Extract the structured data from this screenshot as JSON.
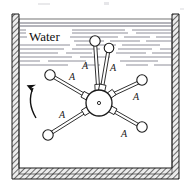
{
  "figure": {
    "medium_label": "Water",
    "arm_label": "A",
    "rotation_direction": "counterclockwise",
    "colors": {
      "outline": "#1a1a1a",
      "water_line": "#5a5a6a",
      "wall_hatch": "#4a4a4a",
      "wall_fill": "#e8e8e8",
      "background": "#ffffff",
      "ball_fill": "#ffffff",
      "hub_fill": "#ffffff"
    },
    "tank": {
      "name": "open-top-tank",
      "outer": {
        "x": 12,
        "y": 14,
        "width": 167,
        "height": 165
      },
      "inner": {
        "x": 19,
        "y": 19,
        "width": 153,
        "height": 155
      },
      "wall_thickness": 6
    },
    "hub": {
      "name": "paddle-wheel-hub",
      "cx": 99,
      "cy": 103,
      "r": 13,
      "center_dot_r": 1.6
    },
    "arms": [
      {
        "id": "arm-upper-vertical",
        "angle_deg": 93,
        "ball_cx": 95,
        "ball_cy": 41,
        "ball_r": 5.2,
        "label": "A",
        "label_x": 85,
        "label_y": 69
      },
      {
        "id": "arm-upper-right-steep",
        "angle_deg": 78,
        "ball_cx": 109,
        "ball_cy": 48,
        "ball_r": 4.8,
        "label": "A",
        "label_x": 113,
        "label_y": 71
      },
      {
        "id": "arm-upper-right",
        "angle_deg": 36,
        "ball_cx": 142,
        "ball_cy": 80,
        "ball_r": 5.2,
        "label": "A",
        "label_x": 136,
        "label_y": 100
      },
      {
        "id": "arm-lower-right",
        "angle_deg": -28,
        "ball_cx": 142,
        "ball_cy": 127,
        "ball_r": 5.2,
        "label": "A",
        "label_x": 124,
        "label_y": 137
      },
      {
        "id": "arm-lower-left",
        "angle_deg": 212,
        "ball_cx": 48,
        "ball_cy": 135,
        "ball_r": 5.2,
        "label": "A",
        "label_x": 62,
        "label_y": 118
      },
      {
        "id": "arm-upper-left",
        "angle_deg": 152,
        "ball_cx": 50,
        "ball_cy": 75,
        "ball_r": 5.2,
        "label": "A",
        "label_x": 72,
        "label_y": 80
      }
    ],
    "rotation_arrow": {
      "name": "rotation-arrow",
      "path": "M 36 118 C 30 108, 29 97, 33 88",
      "arrow_tip": {
        "x": 33,
        "y": 88
      }
    },
    "water_label_pos": {
      "x": 29,
      "y": 41
    },
    "water_surface_y": 22,
    "water_lines": [
      {
        "y": 23,
        "segments": [
          [
            20,
            172
          ]
        ]
      },
      {
        "y": 26,
        "segments": [
          [
            20,
            172
          ]
        ]
      },
      {
        "y": 30,
        "segments": [
          [
            20,
            26
          ],
          [
            72,
            125
          ],
          [
            132,
            172
          ]
        ]
      },
      {
        "y": 33,
        "segments": [
          [
            20,
            26
          ],
          [
            72,
            128
          ],
          [
            136,
            172
          ]
        ]
      },
      {
        "y": 37,
        "segments": [
          [
            20,
            27
          ],
          [
            70,
            118
          ],
          [
            124,
            150
          ],
          [
            156,
            172
          ]
        ]
      },
      {
        "y": 41,
        "segments": [
          [
            74,
            104
          ],
          [
            110,
            140
          ],
          [
            146,
            172
          ]
        ]
      },
      {
        "y": 45,
        "segments": [
          [
            20,
            70
          ],
          [
            76,
            116
          ],
          [
            122,
            160
          ]
        ]
      },
      {
        "y": 49,
        "segments": [
          [
            20,
            64
          ],
          [
            72,
            100
          ],
          [
            118,
            152
          ],
          [
            160,
            172
          ]
        ]
      },
      {
        "y": 53,
        "segments": [
          [
            20,
            58
          ],
          [
            66,
            92
          ],
          [
            116,
            146
          ],
          [
            152,
            172
          ]
        ]
      },
      {
        "y": 57,
        "segments": [
          [
            20,
            72
          ],
          [
            80,
            110
          ],
          [
            130,
            172
          ]
        ]
      },
      {
        "y": 61,
        "segments": [
          [
            20,
            40
          ],
          [
            48,
            86
          ],
          [
            120,
            158
          ]
        ]
      },
      {
        "y": 65,
        "segments": [
          [
            20,
            68
          ],
          [
            84,
            100
          ],
          [
            126,
            148
          ],
          [
            154,
            172
          ]
        ]
      }
    ]
  }
}
